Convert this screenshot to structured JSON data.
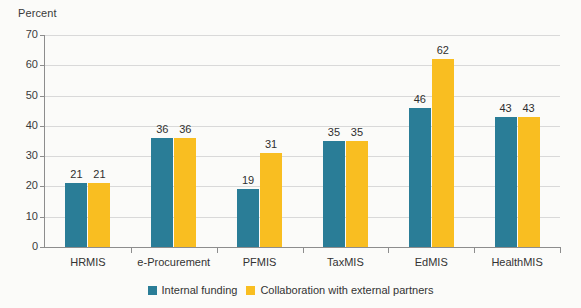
{
  "chart_data": {
    "type": "bar",
    "title": "",
    "subtitle": "",
    "xlabel": "",
    "ylabel": "Percent",
    "ylim": [
      0,
      70
    ],
    "yticks": [
      0,
      10,
      20,
      30,
      40,
      50,
      60,
      70
    ],
    "grid": true,
    "legend_position": "bottom",
    "categories": [
      "HRMIS",
      "e-Procurement",
      "PFMIS",
      "TaxMIS",
      "EdMIS",
      "HealthMIS"
    ],
    "series": [
      {
        "name": "Internal funding",
        "color": "#2a7d97",
        "values": [
          21,
          36,
          19,
          35,
          46,
          43
        ]
      },
      {
        "name": "Collaboration with external partners",
        "color": "#f9be21",
        "values": [
          21,
          36,
          31,
          35,
          62,
          43
        ]
      }
    ],
    "data_labels": [
      [
        "21",
        "21"
      ],
      [
        "36",
        "36"
      ],
      [
        "19",
        "31"
      ],
      [
        "35",
        "35"
      ],
      [
        "46",
        "62"
      ],
      [
        "43",
        "43"
      ]
    ]
  },
  "axis": {
    "y_title": "Percent",
    "y_tick_labels": [
      "70",
      "60",
      "50",
      "40",
      "30",
      "20",
      "10",
      "0"
    ],
    "x_tick_labels": [
      "HRMIS",
      "e-Procurement",
      "PFMIS",
      "TaxMIS",
      "EdMIS",
      "HealthMIS"
    ]
  },
  "legend": {
    "items": [
      {
        "label": "Internal funding",
        "color": "#2a7d97"
      },
      {
        "label": "Collaboration with external partners",
        "color": "#f9be21"
      }
    ]
  },
  "colors": {
    "series_internal": "#2a7d97",
    "series_collaboration": "#f9be21",
    "gridline": "#d9d9d9",
    "axis": "#8d8d8d",
    "background": "#fbfbf9"
  }
}
